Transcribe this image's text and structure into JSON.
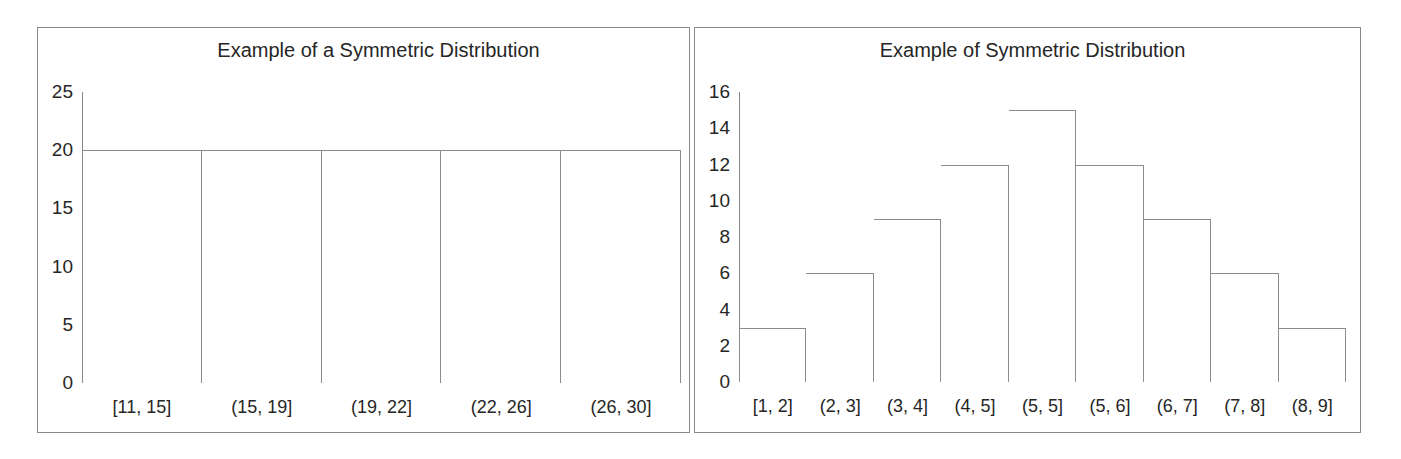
{
  "chart_data": [
    {
      "panel": "left",
      "type": "bar",
      "title": "Example of a Symmetric Distribution",
      "xlabel": "",
      "ylabel": "",
      "categories": [
        "[11, 15]",
        "(15, 19]",
        "(19, 22]",
        "(22, 26]",
        "(26, 30]"
      ],
      "values": [
        20,
        20,
        20,
        20,
        20
      ],
      "yticks": [
        0,
        5,
        10,
        15,
        20,
        25
      ],
      "ylim": [
        0,
        25
      ],
      "grid": false,
      "legend": false,
      "bar_fill": "#ffffff",
      "bar_stroke": "#8c8c8c"
    },
    {
      "panel": "right",
      "type": "bar",
      "title": "Example of Symmetric Distribution",
      "xlabel": "",
      "ylabel": "",
      "categories": [
        "[1, 2]",
        "(2, 3]",
        "(3, 4]",
        "(4, 5]",
        "(5, 5]",
        "(5, 6]",
        "(6, 7]",
        "(7, 8]",
        "(8, 9]"
      ],
      "values": [
        3,
        6,
        9,
        12,
        15,
        12,
        9,
        6,
        3
      ],
      "yticks": [
        0,
        2,
        4,
        6,
        8,
        10,
        12,
        14,
        16
      ],
      "ylim": [
        0,
        16
      ],
      "grid": false,
      "legend": false,
      "bar_fill": "#ffffff",
      "bar_stroke": "#8c8c8c"
    }
  ]
}
